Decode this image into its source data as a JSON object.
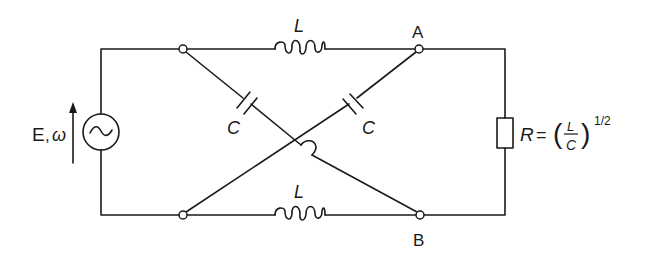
{
  "diagram": {
    "type": "circuit",
    "colors": {
      "stroke": "#1a1a1a",
      "background": "#ffffff"
    },
    "source": {
      "label_E": "E",
      "label_sep": ",",
      "label_omega": "ω",
      "symbol": "~"
    },
    "inductors": [
      {
        "id": "top",
        "label": "L"
      },
      {
        "id": "bottom",
        "label": "L"
      }
    ],
    "capacitors": [
      {
        "id": "left",
        "label": "C"
      },
      {
        "id": "right",
        "label": "C"
      }
    ],
    "nodes": {
      "A": "A",
      "B": "B"
    },
    "resistor": {
      "label_R": "R",
      "equals": "=",
      "paren_open": "(",
      "frac_num": "L",
      "frac_den": "C",
      "paren_close": ")",
      "exponent": "1/2"
    }
  }
}
